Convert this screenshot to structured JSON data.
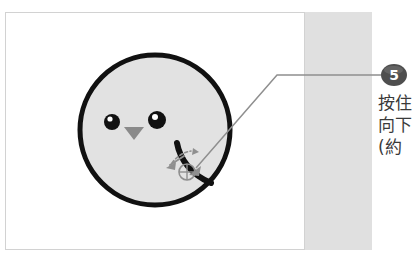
{
  "figure": {
    "background_color": "#ffffff",
    "frame_border_color": "#d2d2d2",
    "side_band_color": "#e0e0e0"
  },
  "illustration": {
    "face": {
      "name": "round-face-shape",
      "fill_color": "#e2e2e2",
      "stroke_color": "#111111",
      "center_x": 155,
      "center_y": 130,
      "radius": 75
    },
    "left_eye": {
      "fill_color": "#111111",
      "highlight_color": "#ffffff"
    },
    "right_eye": {
      "fill_color": "#111111",
      "highlight_color": "#ffffff"
    },
    "nose": {
      "fill_color": "#8a8a8a",
      "shape": "down-triangle"
    },
    "swipe_stroke": {
      "stroke_color": "#111111",
      "description": "thick curved stroke"
    },
    "dashed_arc": {
      "stroke_color": "#8f8f8f"
    },
    "motion_arrow": {
      "stroke_color": "#8f8f8f",
      "direction": "left-down"
    },
    "touch_point": {
      "name": "crosshair-marker",
      "stroke_color": "#8f8f8f",
      "x": 187,
      "y": 172
    }
  },
  "callout": {
    "number": "5",
    "badge_color": "#4e4e4e",
    "badge_text_color": "#ffffff",
    "leader_line_color": "#8f8f8f",
    "text_color": "#3a3a3a",
    "lines": [
      "按住",
      "向下",
      "(約"
    ]
  }
}
